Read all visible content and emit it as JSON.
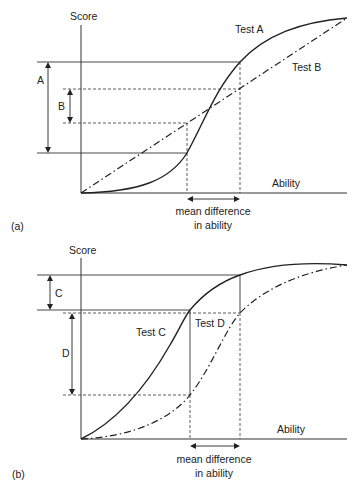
{
  "figure": {
    "panel_a": {
      "label": "(a)",
      "y_axis_label": "Score",
      "x_axis_label": "Ability",
      "curve_1_label": "Test A",
      "curve_2_label": "Test B",
      "interval_1_label": "A",
      "interval_2_label": "B",
      "mean_diff_line1": "mean difference",
      "mean_diff_line2": "in ability"
    },
    "panel_b": {
      "label": "(b)",
      "y_axis_label": "Score",
      "x_axis_label": "Ability",
      "curve_1_label": "Test C",
      "curve_2_label": "Test D",
      "interval_1_label": "C",
      "interval_2_label": "D",
      "mean_diff_line1": "mean difference",
      "mean_diff_line2": "in ability"
    },
    "colors": {
      "line": "#222222",
      "background": "#ffffff"
    }
  }
}
